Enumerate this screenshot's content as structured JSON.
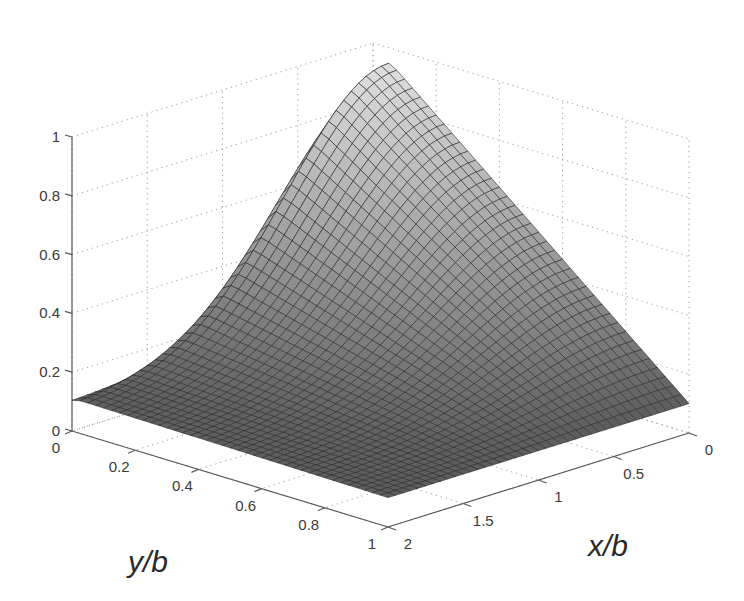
{
  "chart_data": {
    "type": "surface3d",
    "title": "",
    "xlabel": "x/b",
    "ylabel": "y/b",
    "zlabel": "",
    "xlim": [
      0,
      2
    ],
    "ylim": [
      0,
      1
    ],
    "zlim": [
      0,
      1
    ],
    "x_ticks": [
      0,
      0.5,
      1,
      1.5,
      2
    ],
    "x_tick_labels": [
      "0",
      "0.5",
      "1",
      "1.5",
      "2"
    ],
    "y_ticks": [
      0,
      0.2,
      0.4,
      0.6,
      0.8,
      1
    ],
    "y_tick_labels": [
      "0",
      "0.2",
      "0.4",
      "0.6",
      "0.8",
      "1"
    ],
    "z_ticks": [
      0,
      0.2,
      0.4,
      0.6,
      0.8,
      1
    ],
    "z_tick_labels": [
      "0",
      "0.2",
      "0.4",
      "0.6",
      "0.8",
      "1"
    ],
    "grid": true,
    "colormap": "gray",
    "mesh": {
      "nx": 40,
      "ny": 40
    },
    "surface_description": "Value ~1.0 at (x/b=0, y/b=0), decreasing roughly linearly along y/b=0..1 at x/b=0 to ~0.1; steep cliff near y/b=0 for small x/b; flat at ~0.1 for large x/b",
    "sample_points": [
      {
        "x": 0,
        "y": 0.02,
        "z": 1.0
      },
      {
        "x": 0,
        "y": 0.5,
        "z": 0.55
      },
      {
        "x": 0,
        "y": 1.0,
        "z": 0.1
      },
      {
        "x": 0.5,
        "y": 0.02,
        "z": 0.95
      },
      {
        "x": 1.0,
        "y": 0.05,
        "z": 0.55
      },
      {
        "x": 1.0,
        "y": 0.5,
        "z": 0.3
      },
      {
        "x": 2.0,
        "y": 0.0,
        "z": 0.1
      },
      {
        "x": 2.0,
        "y": 1.0,
        "z": 0.1
      }
    ]
  },
  "labels": {
    "x_axis": "x/b",
    "y_axis": "y/b"
  }
}
